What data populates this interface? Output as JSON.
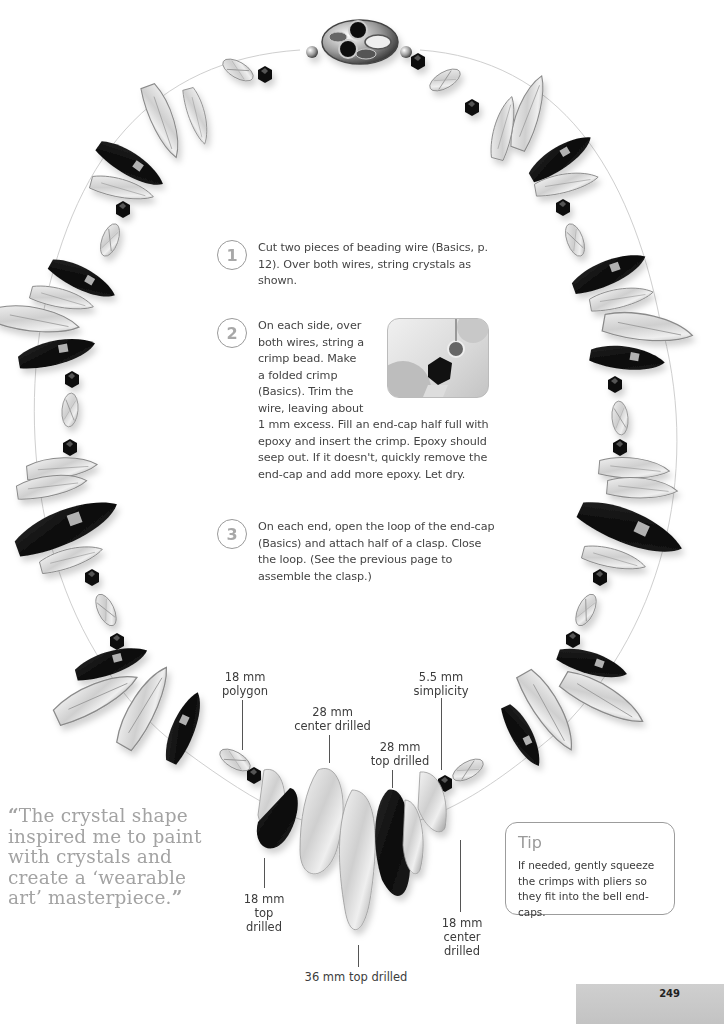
{
  "page": {
    "number": "249",
    "background": "#ffffff",
    "accent_gray": "#a3a3a3"
  },
  "steps": [
    {
      "number": "1",
      "text": "Cut two pieces of beading wire (Basics, p. 12). Over both wires, string crystals as shown."
    },
    {
      "number": "2",
      "text_wrapped": "On each side, over\nboth wires, string a\ncrimp bead. Make\na folded crimp\n(Basics). Trim the\nwire, leaving about",
      "text_continued": "1 mm excess. Fill an end-cap half full with epoxy and insert the crimp. Epoxy should seep out. If it doesn't, quickly remove the end-cap and add more epoxy. Let dry."
    },
    {
      "number": "3",
      "text": "On each end, open the loop of the end-cap (Basics) and attach half of a clasp. Close the loop. (See the previous page to assemble the clasp.)"
    }
  ],
  "inset_photo": {
    "description": "close-up of crimp bead, end-cap and black bicone crystal"
  },
  "labels": [
    {
      "id": "polygon",
      "text": "18 mm\npolygon"
    },
    {
      "id": "center-28",
      "text": "28 mm\ncenter drilled"
    },
    {
      "id": "top-28",
      "text": "28 mm\ntop drilled"
    },
    {
      "id": "simplicity",
      "text": "5.5 mm\nsimplicity"
    },
    {
      "id": "top-18",
      "text": "18 mm\ntop\ndrilled"
    },
    {
      "id": "top-36",
      "text": "36 mm top drilled"
    },
    {
      "id": "center-18",
      "text": "18 mm\ncenter\ndrilled"
    }
  ],
  "quote": {
    "open_mark": "“",
    "text": "The crystal shape inspired me to paint with crystals and create a ‘wearable art’ masterpiece.",
    "close_mark": "”"
  },
  "tip": {
    "title": "Tip",
    "text": "If needed, gently squeeze the crimps with pliers so they fit into the bell end-caps."
  }
}
